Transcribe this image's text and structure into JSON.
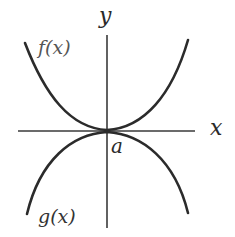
{
  "diagram": {
    "axes": {
      "x_label": "x",
      "y_label": "y",
      "color": "#333333"
    },
    "curves": [
      {
        "name": "f",
        "label": "f(x)",
        "shape": "convex, opening upward, minimum at a",
        "color": "#2b2b2b"
      },
      {
        "name": "g",
        "label": "g(x)",
        "shape": "concave, opening downward, maximum at a",
        "color": "#2b2b2b"
      }
    ],
    "point": {
      "label": "a",
      "description": "x-coordinate where f and g touch (common tangent on x-axis)"
    }
  }
}
